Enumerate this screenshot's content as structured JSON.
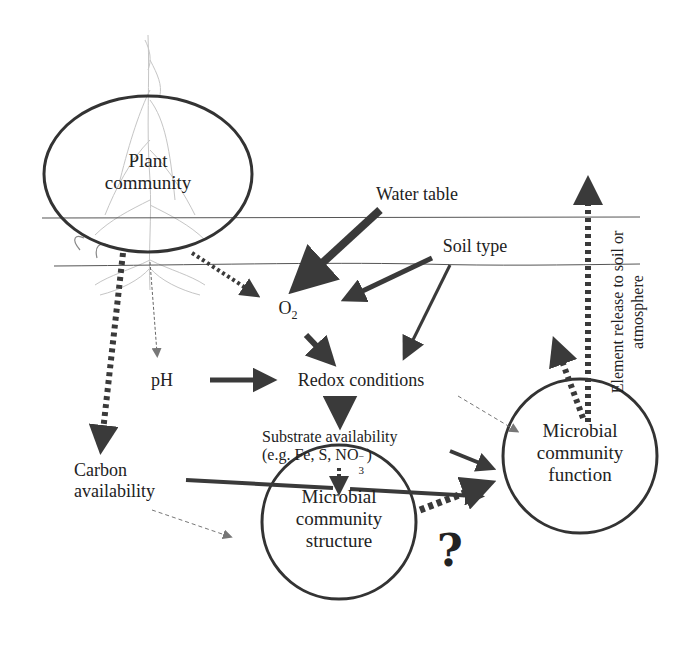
{
  "diagram": {
    "nodes": {
      "plant_community": {
        "line1": "Plant",
        "line2": "community"
      },
      "microbial_structure": {
        "line1": "Microbial",
        "line2": "community",
        "line3": "structure"
      },
      "microbial_function": {
        "line1": "Microbial",
        "line2": "community",
        "line3": "function"
      }
    },
    "variables": {
      "water_table": "Water table",
      "soil_type": "Soil type",
      "o2_base": "O",
      "o2_sub": "2",
      "ph": "pH",
      "redox": "Redox conditions",
      "substrate_line1": "Substrate availability",
      "substrate_line2_prefix": "(e.g. Fe, S, NO",
      "substrate_line2_sub": "3",
      "substrate_line2_sup": "−",
      "substrate_line2_suffix": ")",
      "carbon_line1": "Carbon",
      "carbon_line2": "availability",
      "element_release_line1": "Element release to soil or",
      "element_release_line2": "atmosphere",
      "question_mark": "?"
    },
    "colors": {
      "arrow": "#3a3a3a",
      "dashed_light": "#888888",
      "horizon_line": "#555555",
      "ellipse_stroke": "#333333"
    }
  }
}
